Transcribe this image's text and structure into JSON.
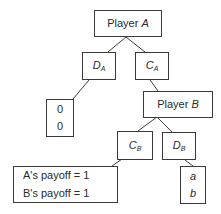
{
  "game_tree": {
    "root": {
      "label": "Player",
      "player": "A"
    },
    "a_moves": [
      {
        "base": "D",
        "sub": "A"
      },
      {
        "base": "C",
        "sub": "A"
      }
    ],
    "defect_payoff": {
      "line1": "0",
      "line2": "0"
    },
    "node_b": {
      "label": "Player",
      "player": "B"
    },
    "b_moves": [
      {
        "base": "C",
        "sub": "B"
      },
      {
        "base": "D",
        "sub": "B"
      }
    ],
    "cooperate_payoff": {
      "line1": "A's payoff = 1",
      "line2": "B's payoff = 1"
    },
    "b_defect_payoff": {
      "line1": "a",
      "line2": "b"
    }
  }
}
